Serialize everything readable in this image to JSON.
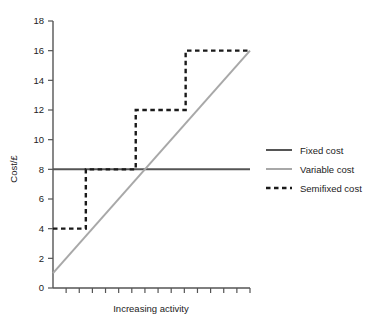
{
  "chart_data": {
    "type": "line",
    "title": "",
    "xlabel": "Increasing activity",
    "ylabel": "Cost/£",
    "xlim": [
      0,
      15
    ],
    "ylim": [
      0,
      18
    ],
    "ytick_labels": [
      "0",
      "2",
      "4",
      "6",
      "8",
      "10",
      "12",
      "14",
      "16",
      "18"
    ],
    "ytick_values": [
      0,
      2,
      4,
      6,
      8,
      10,
      12,
      14,
      16,
      18
    ],
    "xtick_count": 15,
    "xtick_labels": [],
    "grid": false,
    "legend_position": "right",
    "series": [
      {
        "name": "Fixed cost",
        "style": "solid",
        "color": "#555555",
        "x": [
          0,
          15
        ],
        "values": [
          8,
          8
        ]
      },
      {
        "name": "Variable cost",
        "style": "solid",
        "color": "#a8a8a8",
        "x": [
          0,
          15
        ],
        "values": [
          1,
          16
        ]
      },
      {
        "name": "Semifixed cost",
        "style": "dashed",
        "color": "#1a1a1a",
        "x": [
          0,
          2.5,
          2.5,
          6.3,
          6.3,
          10.1,
          10.1,
          15
        ],
        "values": [
          4,
          4,
          8,
          8,
          12,
          12,
          16,
          16
        ]
      }
    ]
  },
  "legend": {
    "items": [
      {
        "label": "Fixed cost",
        "swatch": "solid-dark-line"
      },
      {
        "label": "Variable cost",
        "swatch": "solid-light-line"
      },
      {
        "label": "Semifixed cost",
        "swatch": "dashed-dark-line"
      }
    ]
  },
  "axes": {
    "y_title": "Cost/£",
    "x_title": "Increasing activity",
    "y_labels": [
      "18",
      "16",
      "14",
      "12",
      "10",
      "8",
      "6",
      "4",
      "2",
      "0"
    ]
  },
  "colors": {
    "fixed": "#555555",
    "variable": "#a8a8a8",
    "semifixed": "#1a1a1a",
    "axis": "#555555",
    "text": "#222222",
    "background": "#ffffff"
  }
}
